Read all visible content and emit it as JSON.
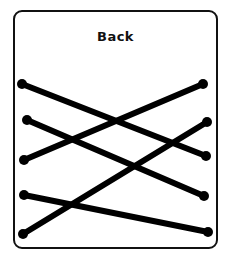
{
  "card": {
    "title": "Back",
    "border_color": "#111111",
    "line_color": "#000000"
  },
  "lines": [
    {
      "x1": 22,
      "y1": 84,
      "x2": 206,
      "y2": 156
    },
    {
      "x1": 27,
      "y1": 120,
      "x2": 204,
      "y2": 196
    },
    {
      "x1": 24,
      "y1": 160,
      "x2": 203,
      "y2": 84
    },
    {
      "x1": 24,
      "y1": 195,
      "x2": 208,
      "y2": 232
    },
    {
      "x1": 23,
      "y1": 234,
      "x2": 207,
      "y2": 122
    }
  ]
}
